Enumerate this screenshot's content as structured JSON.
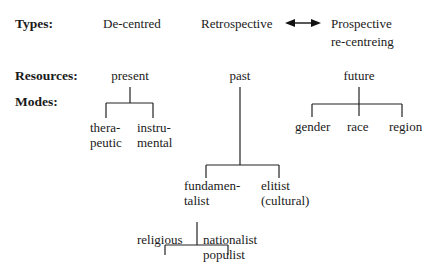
{
  "row_labels": {
    "types": "Types:",
    "resources": "Resources:",
    "modes": "Modes:"
  },
  "types": {
    "decentred": "De-centred",
    "retrospective": "Retrospective",
    "arrow": "double-headed-arrow",
    "prospective_line1": "Prospective",
    "prospective_line2": "re-centreing"
  },
  "resources": {
    "present": "present",
    "past": "past",
    "future": "future"
  },
  "modes": {
    "present": {
      "therapeutic_line1": "thera-",
      "therapeutic_line2": "peutic",
      "instrumental_line1": "instru-",
      "instrumental_line2": "mental"
    },
    "past": {
      "fundamentalist_line1": "fundamen-",
      "fundamentalist_line2": "talist",
      "elitist_line1": "elitist",
      "elitist_line2": "(cultural)",
      "fundamentalist_children": {
        "religious": "religious",
        "nationalist_line1": "nationalist",
        "nationalist_line2": "populist"
      }
    },
    "future": {
      "gender": "gender",
      "race": "race",
      "region": "region"
    }
  }
}
